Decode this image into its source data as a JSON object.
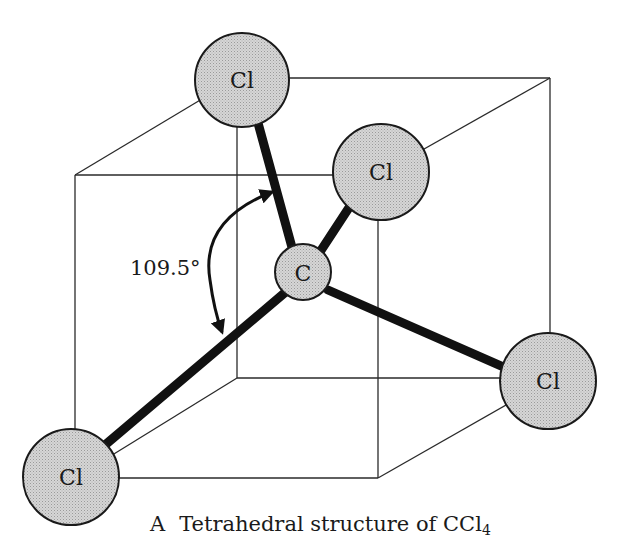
{
  "diagram": {
    "title": "Tetrahedral structure of CCl4",
    "caption": {
      "letter": "A",
      "text": "Tetrahedral structure of CCl",
      "subscript": "4"
    },
    "angle": {
      "label": "109.5°"
    },
    "colors": {
      "atom_fill": "#c9c9c9",
      "bond": "#111111",
      "edge": "#2a2a2a",
      "background": "#ffffff"
    },
    "atoms": [
      {
        "id": "carbon",
        "label": "C"
      },
      {
        "id": "cl-top",
        "label": "Cl"
      },
      {
        "id": "cl-upper-right",
        "label": "Cl"
      },
      {
        "id": "cl-right",
        "label": "Cl"
      },
      {
        "id": "cl-bottom-left",
        "label": "Cl"
      }
    ]
  }
}
